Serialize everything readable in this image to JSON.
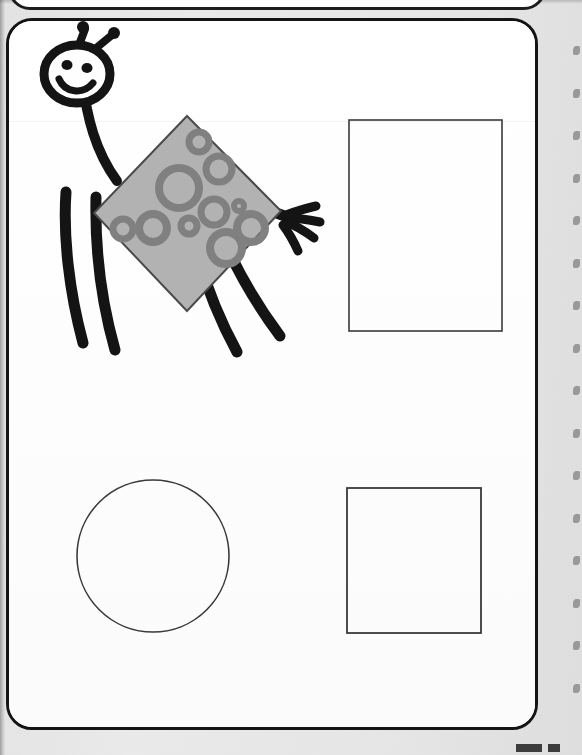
{
  "page": {
    "kind": "scanned-worksheet-page",
    "width": 582,
    "height": 755,
    "background_color": "#e6e6e6",
    "paper_color": "#fefefe",
    "ink_color": "#141414"
  },
  "panels": {
    "top_partial": {
      "label": "partial panel above",
      "visible_height": 10
    },
    "main": {
      "label": "main worksheet panel"
    }
  },
  "colors": {
    "ink": "#141414",
    "outline": "#3a3a3a",
    "diamond_fill": "#b2b2b2",
    "diamond_ring": "#808080",
    "diamond_edge": "#4a4a4a",
    "margin_mark": "#8d8d8d"
  },
  "figure": {
    "name": "cartoon-bug-character",
    "head": {
      "eyes": 2,
      "antennae": 2,
      "mouth": "smile"
    },
    "body": {
      "shape": "diamond",
      "fill": "#b2b2b2",
      "spots": 11,
      "spot_style": "ring"
    },
    "legs": 4,
    "arms": 1,
    "hand_fingers": 4
  },
  "shapes": [
    {
      "name": "tall-rectangle",
      "type": "rectangle",
      "filled": false,
      "x": 346,
      "y": 117,
      "width": 153,
      "height": 211
    },
    {
      "name": "circle",
      "type": "circle",
      "filled": false,
      "cx": 150,
      "cy": 553,
      "r": 76
    },
    {
      "name": "square",
      "type": "square",
      "filled": false,
      "x": 344,
      "y": 485,
      "width": 134,
      "height": 145
    }
  ],
  "margin_marks": {
    "name": "binding-perforations",
    "count": 16,
    "x": 573,
    "start_y": 46,
    "spacing": 42.5
  },
  "bottom_marks": {
    "name": "cropped-page-number",
    "count": 2
  }
}
